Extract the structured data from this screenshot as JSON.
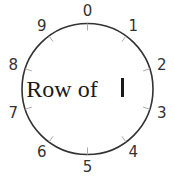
{
  "dial": {
    "center_label": "Row of",
    "center_glyph": "|",
    "digits": [
      "0",
      "1",
      "2",
      "3",
      "4",
      "5",
      "6",
      "7",
      "8",
      "9"
    ],
    "colors": {
      "ring": "#333333",
      "tick": "#aaaaaa",
      "digit": "#333333",
      "text": "#1a1a1a"
    }
  }
}
